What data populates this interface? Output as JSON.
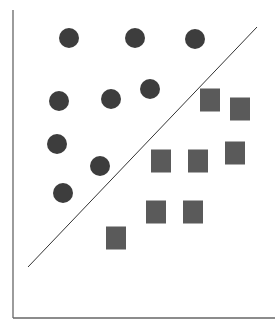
{
  "chart_data": {
    "type": "scatter",
    "title": "",
    "xlabel": "",
    "ylabel": "",
    "grid": false,
    "legend": null,
    "axes": {
      "y_axis": {
        "x": 13,
        "y1": 10,
        "y2": 318
      },
      "x_axis": {
        "y": 318,
        "x1": 13,
        "x2": 275
      }
    },
    "decision_boundary": {
      "x1": 28,
      "y1": 267,
      "x2": 257,
      "y2": 27,
      "color": "#333333"
    },
    "series": [
      {
        "name": "class-circle",
        "marker": "circle",
        "color": "#3d3d3d",
        "radius": 10,
        "points": [
          {
            "x": 69,
            "y": 38
          },
          {
            "x": 135,
            "y": 38
          },
          {
            "x": 195,
            "y": 39
          },
          {
            "x": 59,
            "y": 101
          },
          {
            "x": 111,
            "y": 99
          },
          {
            "x": 150,
            "y": 89
          },
          {
            "x": 57,
            "y": 144
          },
          {
            "x": 100,
            "y": 166
          },
          {
            "x": 63,
            "y": 193
          }
        ]
      },
      {
        "name": "class-square",
        "marker": "square",
        "color": "#5a5a5a",
        "width": 20,
        "height": 23,
        "points": [
          {
            "x": 210,
            "y": 100
          },
          {
            "x": 240,
            "y": 109
          },
          {
            "x": 161,
            "y": 161
          },
          {
            "x": 198,
            "y": 161
          },
          {
            "x": 235,
            "y": 153
          },
          {
            "x": 156,
            "y": 212
          },
          {
            "x": 193,
            "y": 212
          },
          {
            "x": 116,
            "y": 238
          }
        ]
      }
    ]
  }
}
